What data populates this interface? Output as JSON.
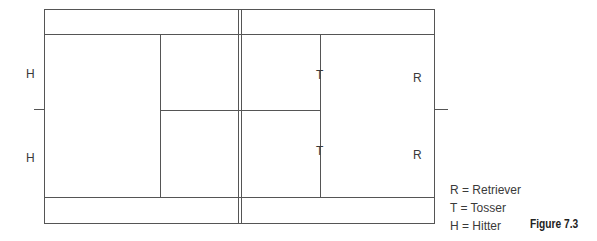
{
  "figure": {
    "caption": "Figure 7.3",
    "court": {
      "line_color": "#555555",
      "players": [
        {
          "symbol": "H",
          "x": 31,
          "y": 74
        },
        {
          "symbol": "H",
          "x": 31,
          "y": 158
        },
        {
          "symbol": "T",
          "x": 319,
          "y": 76
        },
        {
          "symbol": "T",
          "x": 319,
          "y": 152
        },
        {
          "symbol": "R",
          "x": 417,
          "y": 78
        },
        {
          "symbol": "R",
          "x": 417,
          "y": 156
        }
      ]
    },
    "legend": [
      {
        "text": "R = Retriever"
      },
      {
        "text": "T = Tosser"
      },
      {
        "text": "H = Hitter"
      }
    ]
  }
}
